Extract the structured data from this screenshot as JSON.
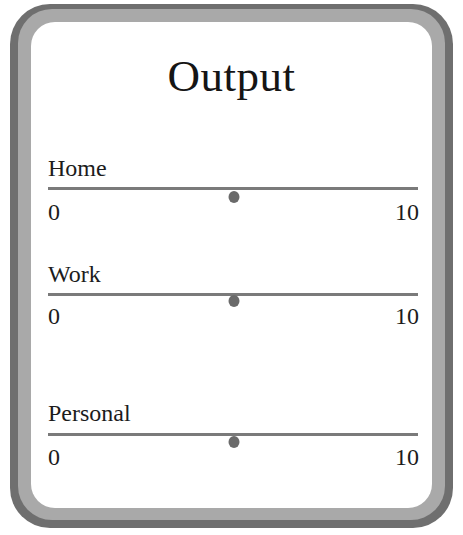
{
  "window": {
    "title": "Output"
  },
  "sliders": [
    {
      "label": "Home",
      "min": "0",
      "max": "10",
      "value": 5
    },
    {
      "label": "Work",
      "min": "0",
      "max": "10",
      "value": 5
    },
    {
      "label": "Personal",
      "min": "0",
      "max": "10",
      "value": 5
    }
  ],
  "colors": {
    "frame_outer": "#6f6f6f",
    "frame_inner": "#a9a9a9",
    "panel": "#ffffff",
    "track": "#7a7a7a",
    "knob": "#6a6a6a"
  }
}
